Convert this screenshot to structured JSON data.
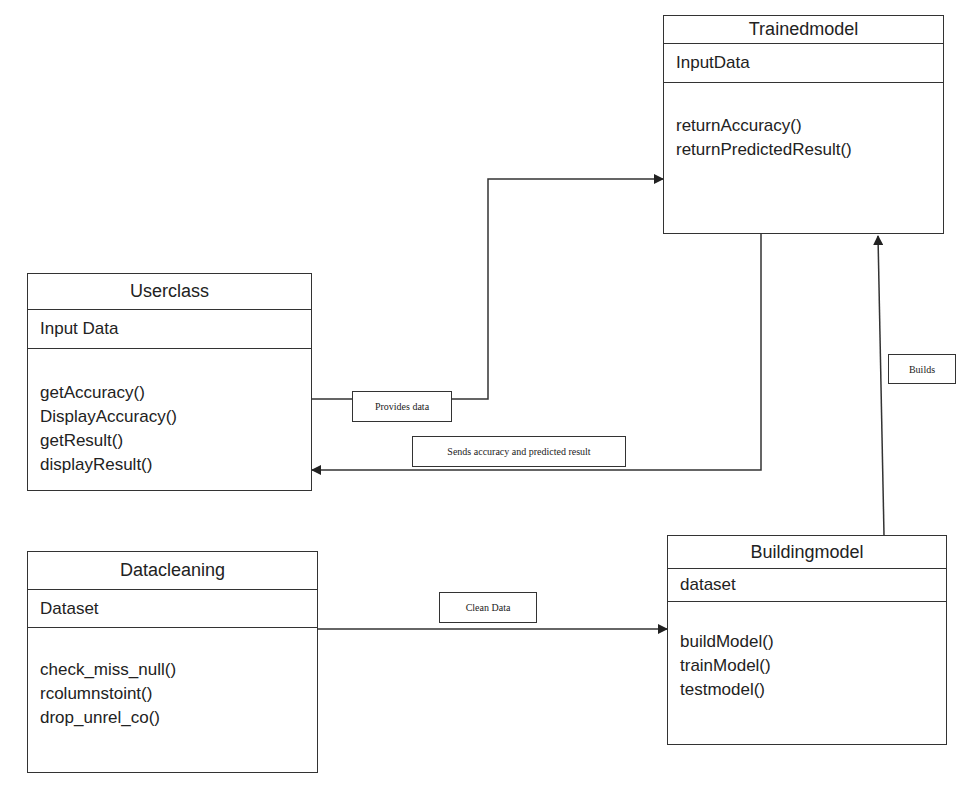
{
  "diagram": {
    "type": "UML class diagram",
    "classes": {
      "trainedmodel": {
        "name": "Trainedmodel",
        "attributes": [
          "InputData"
        ],
        "methods": [
          "returnAccuracy()",
          "returnPredictedResult()"
        ]
      },
      "userclass": {
        "name": "Userclass",
        "attributes": [
          "Input Data"
        ],
        "methods": [
          "getAccuracy()",
          "DisplayAccuracy()",
          "getResult()",
          "displayResult()"
        ]
      },
      "datacleaning": {
        "name": "Datacleaning",
        "attributes": [
          "Dataset"
        ],
        "methods": [
          "check_miss_null()",
          "rcolumnstoint()",
          "drop_unrel_co()"
        ]
      },
      "buildingmodel": {
        "name": "Buildingmodel",
        "attributes": [
          "dataset"
        ],
        "methods": [
          "buildModel()",
          "trainModel()",
          "testmodel()"
        ]
      }
    },
    "relations": [
      {
        "from": "Userclass",
        "to": "Trainedmodel",
        "label": "Provides data"
      },
      {
        "from": "Trainedmodel",
        "to": "Userclass",
        "label": "Sends accuracy and predicted result"
      },
      {
        "from": "Datacleaning",
        "to": "Buildingmodel",
        "label": "Clean Data"
      },
      {
        "from": "Buildingmodel",
        "to": "Trainedmodel",
        "label": "Builds"
      }
    ]
  }
}
